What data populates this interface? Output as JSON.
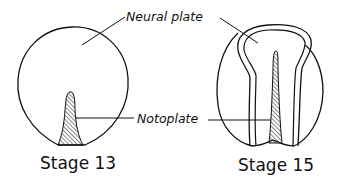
{
  "diagram": {
    "labels": {
      "neural_plate": "Neural plate",
      "notoplate": "Notoplate"
    },
    "stages": [
      {
        "id": "stage-13",
        "caption": "Stage 13"
      },
      {
        "id": "stage-15",
        "caption": "Stage 15"
      }
    ],
    "colors": {
      "ink": "#111111",
      "background": "#ffffff"
    }
  }
}
